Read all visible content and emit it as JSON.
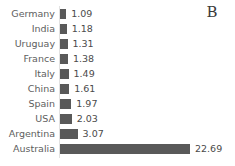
{
  "panel": {
    "label": "B"
  },
  "chart_data": {
    "type": "bar",
    "orientation": "horizontal",
    "title": "",
    "xlabel": "",
    "ylabel": "",
    "categories": [
      "Germany",
      "India",
      "Uruguay",
      "France",
      "Italy",
      "China",
      "Spain",
      "USA",
      "Argentina",
      "Australia"
    ],
    "values": [
      1.09,
      1.18,
      1.31,
      1.38,
      1.49,
      1.61,
      1.97,
      2.03,
      3.07,
      22.69
    ],
    "value_labels": [
      "1.09",
      "1.18",
      "1.31",
      "1.38",
      "1.49",
      "1.61",
      "1.97",
      "2.03",
      "3.07",
      "22.69"
    ],
    "xlim": [
      0,
      22.69
    ],
    "grid": false,
    "legend": false,
    "bar_color": "#595959",
    "label_color": "#5e5e5e",
    "background": "#ffffff"
  }
}
